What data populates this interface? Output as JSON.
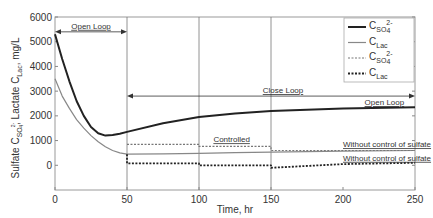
{
  "chart_data": {
    "type": "line",
    "title": "",
    "xlabel": "Time, hr",
    "ylabel": "Sulfate C_SO4^2-, Lactate C_Lac, mg/L",
    "ylabel_parts": {
      "prefix": "Sulfate C",
      "sub1": "SO",
      "sub1b": "4",
      "sup1": "2-",
      "mid": ", Lactate C",
      "sub2": "Lac",
      "suffix": ", mg/L"
    },
    "xlim": [
      0,
      250
    ],
    "ylim": [
      -1000,
      6000
    ],
    "xticks": [
      "0",
      "50",
      "100",
      "150",
      "200",
      "250"
    ],
    "yticks": [
      "6000",
      "5000",
      "4000",
      "3000",
      "2000",
      "1000",
      "0"
    ],
    "xtick_values": [
      0,
      50,
      100,
      150,
      200,
      250
    ],
    "ytick_values": [
      6000,
      5000,
      4000,
      3000,
      2000,
      1000,
      0
    ],
    "grid": "vertical lines at x=50,100,150",
    "legend_position": "upper right",
    "legend": [
      {
        "label_main": "C",
        "label_sub": "SO",
        "label_sub2": "4",
        "label_sup": "2-",
        "style": "solid-dark"
      },
      {
        "label_main": "C",
        "label_sub": "Lac",
        "label_sub2": "",
        "label_sup": "",
        "style": "solid-light"
      },
      {
        "label_main": "C",
        "label_sub": "SO",
        "label_sub2": "4",
        "label_sup": "2-",
        "style": "dotted-light"
      },
      {
        "label_main": "C",
        "label_sub": "Lac",
        "label_sub2": "",
        "label_sup": "",
        "style": "dotted-dark"
      }
    ],
    "series": [
      {
        "name": "C_SO4 (open loop)",
        "style": "solid-dark",
        "x": [
          0,
          5,
          10,
          15,
          20,
          25,
          30,
          35,
          40,
          45,
          50,
          75,
          100,
          125,
          150,
          200,
          250
        ],
        "y": [
          5300,
          4300,
          3400,
          2600,
          2000,
          1550,
          1300,
          1200,
          1220,
          1280,
          1350,
          1700,
          1950,
          2100,
          2200,
          2300,
          2350
        ]
      },
      {
        "name": "C_Lac (open loop)",
        "style": "solid-light",
        "x": [
          0,
          5,
          10,
          15,
          20,
          25,
          30,
          35,
          40,
          45,
          50,
          75,
          100,
          125,
          150,
          200,
          250
        ],
        "y": [
          3500,
          2800,
          2300,
          1850,
          1500,
          1200,
          950,
          750,
          600,
          500,
          450,
          460,
          480,
          510,
          530,
          570,
          600
        ]
      },
      {
        "name": "C_SO4 (controlled / without control of sulfate)",
        "style": "dotted-light",
        "x": [
          50,
          100,
          100,
          150,
          150,
          250
        ],
        "y": [
          850,
          850,
          770,
          770,
          600,
          600
        ]
      },
      {
        "name": "C_Lac (controlled / without control of sulfate)",
        "style": "dotted-dark",
        "x": [
          50,
          50,
          100,
          100,
          150,
          150,
          200,
          250
        ],
        "y": [
          450,
          80,
          80,
          0,
          0,
          -100,
          50,
          100
        ]
      }
    ],
    "annotations": [
      {
        "text": "Open Loop",
        "x_range": [
          0,
          50
        ],
        "y": 5400,
        "type": "double-arrow"
      },
      {
        "text": "Close Loop",
        "x_range": [
          50,
          250
        ],
        "y": 2800,
        "type": "double-arrow"
      },
      {
        "text": "Open Loop",
        "x": 215,
        "y": 2350
      },
      {
        "text": "Controlled",
        "x": 110,
        "y": 850
      },
      {
        "text": "Without control of sulfate",
        "x": 200,
        "y": 650
      },
      {
        "text": "Without control of sulfate",
        "x": 200,
        "y": 100
      }
    ]
  }
}
